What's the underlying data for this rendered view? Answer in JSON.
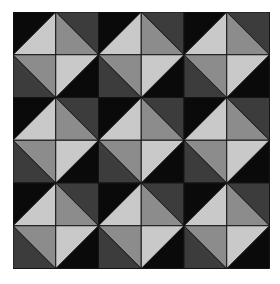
{
  "pattern": {
    "rows": 3,
    "cols": 3,
    "block_size": 85.5,
    "origin": [
      13,
      12
    ],
    "colors": {
      "black": "#0a0a0a",
      "dark_gray": "#3c3c3c",
      "mid_gray": "#8c8c8c",
      "light_gray": "#c9c9c9",
      "line": "#141414"
    },
    "block_quarters": {
      "top_left": {
        "outer": "black",
        "inner": "light_gray"
      },
      "top_right": {
        "outer": "dark_gray",
        "inner": "mid_gray"
      },
      "bottom_left": {
        "outer": "dark_gray",
        "inner": "mid_gray"
      },
      "bottom_right": {
        "outer": "black",
        "inner": "light_gray"
      }
    }
  }
}
